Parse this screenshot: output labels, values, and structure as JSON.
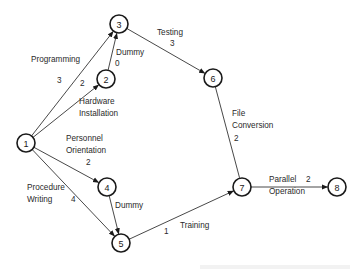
{
  "nodes": [
    {
      "id": "1",
      "label": "1"
    },
    {
      "id": "2",
      "label": "2"
    },
    {
      "id": "3",
      "label": "3"
    },
    {
      "id": "4",
      "label": "4"
    },
    {
      "id": "5",
      "label": "5"
    },
    {
      "id": "6",
      "label": "6"
    },
    {
      "id": "7",
      "label": "7"
    },
    {
      "id": "8",
      "label": "8"
    }
  ],
  "edges": [
    {
      "from": "1",
      "to": "3",
      "activity": [
        "Programming"
      ],
      "duration": "3",
      "arrow": true
    },
    {
      "from": "1",
      "to": "2",
      "activity": [
        "Hardware",
        "Installation"
      ],
      "duration": "2",
      "arrow": true
    },
    {
      "from": "2",
      "to": "3",
      "activity": [
        "Dummy"
      ],
      "duration": "0",
      "arrow": true
    },
    {
      "from": "3",
      "to": "6",
      "activity": [
        "Testing"
      ],
      "duration": "3",
      "arrow": true
    },
    {
      "from": "1",
      "to": "4",
      "activity": [
        "Personnel",
        "Orientation"
      ],
      "duration": "2",
      "arrow": true
    },
    {
      "from": "1",
      "to": "5",
      "activity": [
        "Procedure",
        "Writing"
      ],
      "duration": "4",
      "arrow": true
    },
    {
      "from": "4",
      "to": "5",
      "activity": [
        "Dummy"
      ],
      "duration": "",
      "arrow": true
    },
    {
      "from": "6",
      "to": "7",
      "activity": [
        "File",
        "Conversion"
      ],
      "duration": "2",
      "arrow": false
    },
    {
      "from": "5",
      "to": "7",
      "activity": [
        "Training"
      ],
      "duration": "1",
      "arrow": true
    },
    {
      "from": "7",
      "to": "8",
      "activity": [
        "Parallel",
        "Operation"
      ],
      "duration": "2",
      "arrow": true
    }
  ]
}
